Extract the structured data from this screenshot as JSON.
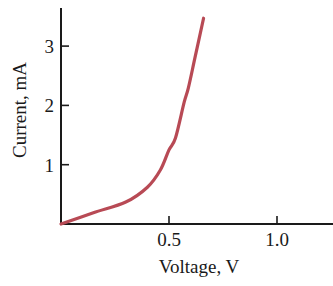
{
  "chart_data": {
    "type": "line",
    "title": "",
    "xlabel": "Voltage, V",
    "ylabel": "Current, mA",
    "xlim": [
      0,
      1.25
    ],
    "ylim": [
      0,
      3.7
    ],
    "xticks": [
      0.5,
      1.0
    ],
    "xtick_labels": [
      "0.5",
      "1.0"
    ],
    "yticks": [
      1,
      2,
      3
    ],
    "ytick_labels": [
      "1",
      "2",
      "3"
    ],
    "grid": false,
    "legend": null,
    "series": [
      {
        "name": "I-V curve",
        "color": "#b84a55",
        "x": [
          0.0,
          0.15,
          0.3,
          0.4,
          0.46,
          0.5,
          0.53,
          0.57,
          0.59,
          0.62,
          0.66
        ],
        "y": [
          0.0,
          0.19,
          0.37,
          0.62,
          0.91,
          1.25,
          1.45,
          2.05,
          2.3,
          2.8,
          3.47
        ]
      }
    ]
  },
  "layout": {
    "origin_px": [
      61,
      224
    ],
    "px_per_x_unit": 216,
    "px_per_y_unit": 59.3,
    "x_axis_end_px": 333,
    "y_axis_top_px": 8
  }
}
